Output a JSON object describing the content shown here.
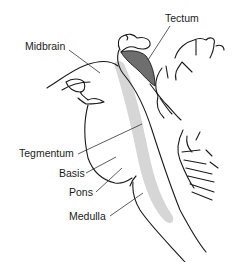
{
  "diagram": {
    "labels": {
      "midbrain": "Midbrain",
      "tectum": "Tectum",
      "tegmentum": "Tegmentum",
      "basis": "Basis",
      "pons": "Pons",
      "medulla": "Medulla"
    },
    "colors": {
      "tectum_fill": "#6e6e6e",
      "tegmentum_band": "#d6d6d6",
      "outline": "#1a1a1a"
    }
  }
}
